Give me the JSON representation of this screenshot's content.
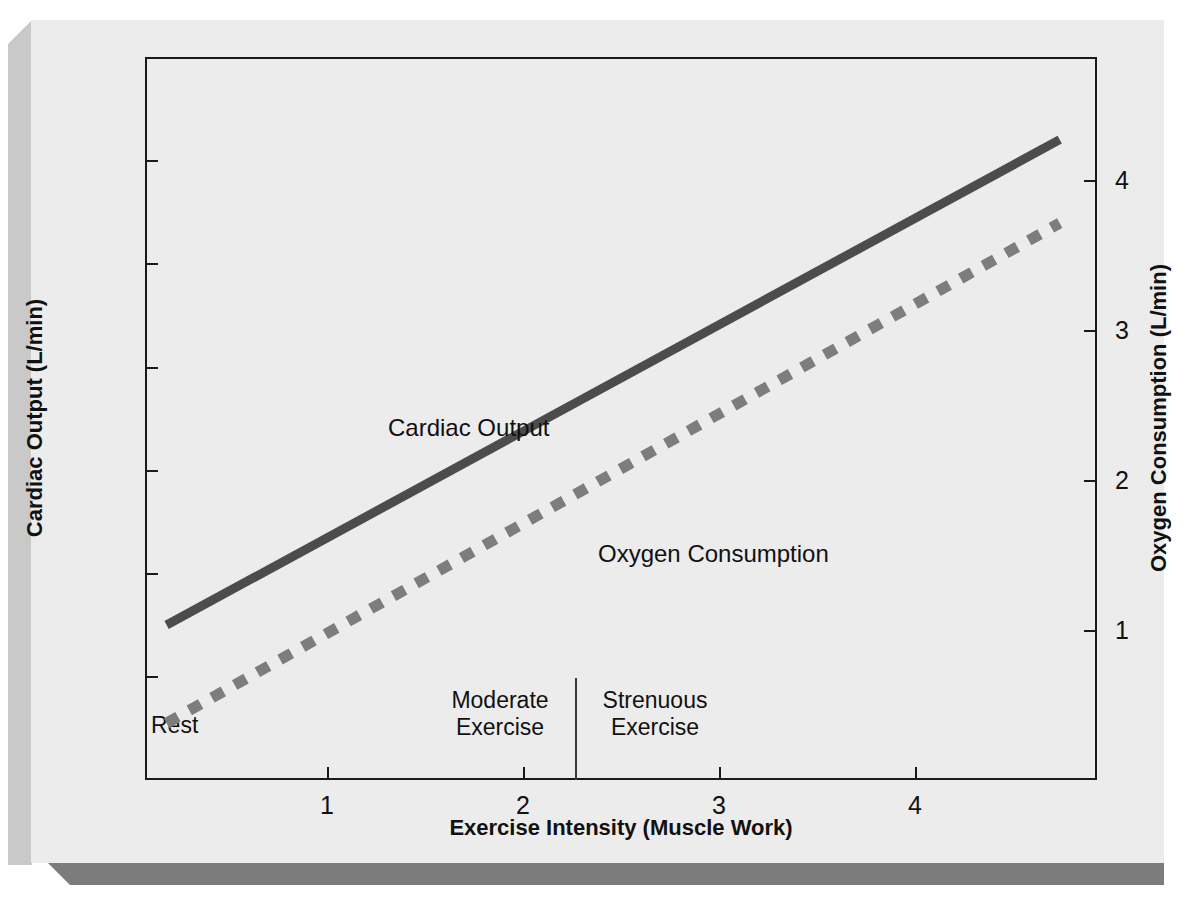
{
  "chart_data": {
    "type": "line",
    "title": "",
    "xlabel": "Exercise Intensity (Muscle Work)",
    "ylabel": "Cardiac Output (L/min)",
    "y2label": "Oxygen Consumption (L/min)",
    "xlim": [
      0,
      4.85
    ],
    "ylim": [
      0,
      35
    ],
    "y2lim": [
      0,
      4.83
    ],
    "grid": false,
    "legend_position": "inline-annotations",
    "xticks": [
      1,
      2,
      3,
      4
    ],
    "xtick_labels": [
      "1",
      "2",
      "3",
      "4"
    ],
    "yticks": [
      0,
      5,
      10,
      15,
      20,
      25,
      30,
      35
    ],
    "ytick_labels": [
      "0",
      "5",
      "10",
      "15",
      "20",
      "25",
      "30",
      "35"
    ],
    "y2ticks": [
      1,
      2,
      3,
      4
    ],
    "y2tick_labels": [
      "1",
      "2",
      "3",
      "4"
    ],
    "series": [
      {
        "name": "Cardiac Output",
        "axis": "left",
        "style": "solid",
        "color": "#4c4c4c",
        "width": 9,
        "x": [
          0.11,
          4.66
        ],
        "values": [
          7.5,
          31.0
        ]
      },
      {
        "name": "Oxygen Consumption",
        "axis": "right",
        "style": "dashed",
        "color": "#7d7d7d",
        "width": 11,
        "x": [
          0.11,
          4.66
        ],
        "values": [
          0.38,
          3.72
        ],
        "values_left_axis_equivalent": [
          2.7,
          25.4
        ]
      }
    ],
    "annotations": [
      {
        "name": "Cardiac Output",
        "x": 1.63,
        "y": 18.6
      },
      {
        "name": "Oxygen Consumption",
        "x": 2.63,
        "y": 12.4
      }
    ],
    "zones": [
      {
        "label": "Rest",
        "x_start": 0.0,
        "x_end": 0.7
      },
      {
        "label": "Moderate\nExercise",
        "x_start": 0.7,
        "x_end": 2.28
      },
      {
        "label": "Strenuous\nExercise",
        "x_start": 2.28,
        "x_end": 4.85
      }
    ],
    "zone_divider_x": 2.28,
    "colors": {
      "background": "#ececec",
      "axis": "#1a1a1a",
      "cardiac_output": "#4c4c4c",
      "oxygen_consumption": "#7d7d7d",
      "shadow_bottom": "#7c7c7c",
      "shadow_left": "#c9c9c9"
    }
  },
  "axes": {
    "left": {
      "title": "Cardiac Output (L/min)",
      "ticks": [
        {
          "label": "0",
          "top": 723
        },
        {
          "label": "5",
          "top": 619
        },
        {
          "label": "10",
          "top": 516
        },
        {
          "label": "15",
          "top": 413
        },
        {
          "label": "20",
          "top": 310
        },
        {
          "label": "25",
          "top": 206
        },
        {
          "label": "30",
          "top": 103
        },
        {
          "label": "35",
          "top": 0
        }
      ]
    },
    "right": {
      "title": "Oxygen Consumption (L/min)",
      "ticks": [
        {
          "label": "1",
          "top": 573
        },
        {
          "label": "2",
          "top": 423
        },
        {
          "label": "3",
          "top": 273
        },
        {
          "label": "4",
          "top": 123
        }
      ]
    },
    "bottom": {
      "title": "Exercise Intensity (Muscle Work)",
      "ticks": [
        {
          "label": "1",
          "left": 182
        },
        {
          "label": "2",
          "left": 378
        },
        {
          "label": "3",
          "left": 574
        },
        {
          "label": "4",
          "left": 770
        }
      ]
    }
  },
  "zones": {
    "rest": "Rest",
    "moderate_line1": "Moderate",
    "moderate_line2": "Exercise",
    "strenuous_line1": "Strenuous",
    "strenuous_line2": "Exercise"
  },
  "annotations": {
    "cardiac_output": "Cardiac Output",
    "oxygen_consumption": "Oxygen Consumption"
  }
}
